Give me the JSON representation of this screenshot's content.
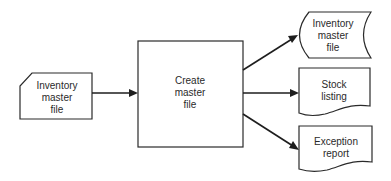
{
  "diagram": {
    "type": "system flowchart",
    "colors": {
      "stroke": "#2a2a2a",
      "background": "#ffffff",
      "text": "#2a2a2a"
    },
    "nodes": [
      {
        "id": "input",
        "shape": "punched-card",
        "lines": [
          "Inventory",
          "master",
          "file"
        ]
      },
      {
        "id": "process",
        "shape": "process-box",
        "lines": [
          "Create",
          "master",
          "file"
        ]
      },
      {
        "id": "out-master",
        "shape": "magnetic-tape",
        "lines": [
          "Inventory",
          "master",
          "file"
        ]
      },
      {
        "id": "out-stock",
        "shape": "document",
        "lines": [
          "Stock",
          "listing"
        ]
      },
      {
        "id": "out-exception",
        "shape": "document",
        "lines": [
          "Exception",
          "report"
        ]
      }
    ],
    "edges": [
      {
        "from": "input",
        "to": "process"
      },
      {
        "from": "process",
        "to": "out-master"
      },
      {
        "from": "process",
        "to": "out-stock"
      },
      {
        "from": "process",
        "to": "out-exception"
      }
    ]
  }
}
